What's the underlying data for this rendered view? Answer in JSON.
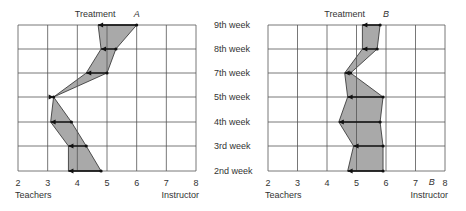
{
  "chart_data": [
    {
      "type": "area",
      "panel": "A",
      "title": "Treatment",
      "panel_label": "A",
      "xlabel_left": "Teachers",
      "xlabel_right": "Instructor",
      "xlim": [
        2,
        8
      ],
      "xticks": [
        "2",
        "3",
        "4",
        "5",
        "6",
        "7",
        "8"
      ],
      "categories": [
        "9th week",
        "8th week",
        "7th week",
        "5th week",
        "4th week",
        "3rd week",
        "2nd week"
      ],
      "series": [
        {
          "name": "Instructor",
          "values": [
            6.0,
            5.3,
            5.0,
            3.2,
            3.8,
            4.3,
            4.8
          ]
        },
        {
          "name": "Teachers",
          "values": [
            4.7,
            4.8,
            4.3,
            3.2,
            3.1,
            3.7,
            3.7
          ]
        }
      ],
      "grid": true
    },
    {
      "type": "area",
      "panel": "B",
      "title": "Treatment",
      "panel_label": "B",
      "xlabel_left": "Teachers",
      "xlabel_right": "Instructor",
      "xlim": [
        2,
        8
      ],
      "xticks": [
        "2",
        "3",
        "4",
        "5",
        "6",
        "7",
        "8"
      ],
      "categories": [
        "9th week",
        "8th week",
        "7th week",
        "5th week",
        "4th week",
        "3rd week",
        "2nd week"
      ],
      "series": [
        {
          "name": "Instructor",
          "values": [
            5.8,
            5.7,
            4.8,
            5.9,
            5.8,
            5.9,
            5.9
          ]
        },
        {
          "name": "Teachers",
          "values": [
            5.2,
            5.2,
            4.6,
            4.7,
            4.4,
            4.9,
            4.7
          ]
        }
      ],
      "grid": true
    }
  ],
  "colors": {
    "fill": "#a9a9a9",
    "line": "#2b2b2b",
    "grid": "#555555"
  }
}
